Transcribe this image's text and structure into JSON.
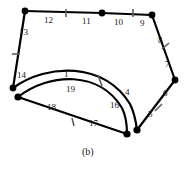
{
  "figure": {
    "caption": "(b)",
    "caption_pos": [
      82,
      146
    ],
    "stroke_color": "#000000",
    "tick_color": "#6e6e6e",
    "label_color": "#1a1a1a",
    "background": "#ffffff",
    "width": 191,
    "height": 170,
    "vertices": [
      {
        "name": "v-top-left",
        "x": 25,
        "y": 11
      },
      {
        "name": "v-top-mid",
        "x": 102,
        "y": 13
      },
      {
        "name": "v-top-right",
        "x": 152,
        "y": 15
      },
      {
        "name": "v-right",
        "x": 175,
        "y": 80
      },
      {
        "name": "v-bottom-right",
        "x": 137,
        "y": 130
      },
      {
        "name": "v-bottom-mid",
        "x": 127,
        "y": 134
      },
      {
        "name": "v-left-lower",
        "x": 18,
        "y": 97
      },
      {
        "name": "v-left-upper",
        "x": 13,
        "y": 88
      }
    ],
    "edges": [
      {
        "name": "edge-12",
        "label": "12",
        "from": "v-top-left",
        "to": "v-top-mid",
        "type": "line",
        "tick": [
          66,
          13
        ],
        "label_pos": [
          44,
          16
        ]
      },
      {
        "name": "edge-11",
        "label": "11",
        "from": "v-top-left",
        "to": "v-top-mid",
        "type": "line",
        "tick": null,
        "label_pos": [
          82,
          17
        ]
      },
      {
        "name": "edge-10",
        "label": "10",
        "from": "v-top-mid",
        "to": "v-top-right",
        "type": "line",
        "tick": [
          133,
          13
        ],
        "label_pos": [
          114,
          18
        ]
      },
      {
        "name": "edge-9",
        "label": "9",
        "from": "v-top-mid",
        "to": "v-top-right",
        "type": "line",
        "tick": null,
        "label_pos": [
          140,
          19
        ]
      },
      {
        "name": "edge-8",
        "label": "8",
        "from": "v-top-right",
        "to": "v-right",
        "type": "line",
        "tick": [
          166,
          46
        ],
        "label_pos": [
          158,
          36
        ]
      },
      {
        "name": "edge-7",
        "label": "7",
        "from": "v-top-right",
        "to": "v-right",
        "type": "line",
        "tick": null,
        "label_pos": [
          166,
          60
        ]
      },
      {
        "name": "edge-6",
        "label": "6",
        "from": "v-right",
        "to": "v-bottom-right",
        "type": "line",
        "tick": [
          159,
          107
        ],
        "label_pos": [
          164,
          90
        ]
      },
      {
        "name": "edge-5",
        "label": "5",
        "from": "v-right",
        "to": "v-bottom-right",
        "type": "line",
        "tick": null,
        "label_pos": [
          148,
          110
        ]
      },
      {
        "name": "edge-13",
        "label": "13",
        "from": "v-top-left",
        "to": "v-left-upper",
        "type": "line",
        "tick": [
          16,
          54
        ],
        "label_pos": [
          20,
          28
        ]
      },
      {
        "name": "edge-14",
        "label": "14",
        "from": "v-top-left",
        "to": "v-left-upper",
        "type": "line",
        "tick": null,
        "label_pos": [
          18,
          72
        ]
      },
      {
        "name": "edge-18",
        "label": "18",
        "from": "v-left-lower",
        "to": "v-bottom-mid",
        "type": "line",
        "tick": [
          73,
          122
        ],
        "label_pos": [
          48,
          104
        ]
      },
      {
        "name": "edge-17",
        "label": "17",
        "from": "v-left-lower",
        "to": "v-bottom-mid",
        "type": "line",
        "tick": null,
        "label_pos": [
          88,
          120
        ]
      },
      {
        "name": "edge-1",
        "label": "1",
        "from": "v-left-upper",
        "to": "v-bottom-right",
        "type": "curve",
        "tick": [
          100,
          81
        ],
        "label_pos": [
          62,
          70
        ]
      },
      {
        "name": "edge-4",
        "label": "4",
        "from": "v-left-upper",
        "to": "v-bottom-right",
        "type": "curve",
        "tick": null,
        "label_pos": [
          126,
          89
        ]
      },
      {
        "name": "edge-19",
        "label": "19",
        "from": "v-left-lower",
        "to": "v-bottom-mid",
        "type": "curve",
        "tick": null,
        "label_pos": [
          68,
          84
        ]
      },
      {
        "name": "edge-16",
        "label": "16",
        "from": "v-left-lower",
        "to": "v-bottom-mid",
        "type": "curve",
        "tick": null,
        "label_pos": [
          112,
          102
        ]
      }
    ],
    "labels": [
      {
        "name": "edge-label-12",
        "text": "12",
        "x": 44,
        "y": 16
      },
      {
        "name": "edge-label-11",
        "text": "11",
        "x": 82,
        "y": 17
      },
      {
        "name": "edge-label-10",
        "text": "10",
        "x": 114,
        "y": 18
      },
      {
        "name": "edge-label-9",
        "text": "9",
        "x": 140,
        "y": 19
      },
      {
        "name": "edge-label-8",
        "text": "8",
        "x": 158,
        "y": 36
      },
      {
        "name": "edge-label-7",
        "text": "7",
        "x": 165,
        "y": 60
      },
      {
        "name": "edge-label-6",
        "text": "6",
        "x": 163,
        "y": 89
      },
      {
        "name": "edge-label-5",
        "text": "5",
        "x": 148,
        "y": 110
      },
      {
        "name": "edge-label-13",
        "text": "13",
        "x": 19,
        "y": 28
      },
      {
        "name": "edge-label-14",
        "text": "14",
        "x": 17,
        "y": 71
      },
      {
        "name": "edge-label-1",
        "text": "1",
        "x": 64,
        "y": 70
      },
      {
        "name": "edge-label-19",
        "text": "19",
        "x": 66,
        "y": 85
      },
      {
        "name": "edge-label-18",
        "text": "18",
        "x": 47,
        "y": 103
      },
      {
        "name": "edge-label-17",
        "text": "17",
        "x": 89,
        "y": 119
      },
      {
        "name": "edge-label-16",
        "text": "16",
        "x": 110,
        "y": 101
      },
      {
        "name": "edge-label-4",
        "text": "4",
        "x": 125,
        "y": 88
      }
    ],
    "ticks": [
      {
        "name": "tick-edge-12-11",
        "x": 66,
        "y": 13,
        "angle": 80
      },
      {
        "name": "tick-edge-10-9",
        "x": 133,
        "y": 13,
        "angle": 85
      },
      {
        "name": "tick-edge-8-7",
        "x": 165,
        "y": 46,
        "angle": 20
      },
      {
        "name": "tick-edge-6-5",
        "x": 158,
        "y": 107,
        "angle": 30
      },
      {
        "name": "tick-edge-13-14",
        "x": 16,
        "y": 54,
        "angle": 95
      },
      {
        "name": "tick-edge-18-17",
        "x": 73,
        "y": 122,
        "angle": 75
      },
      {
        "name": "tick-edge-1-4",
        "x": 100,
        "y": 80,
        "angle": 70
      }
    ]
  }
}
